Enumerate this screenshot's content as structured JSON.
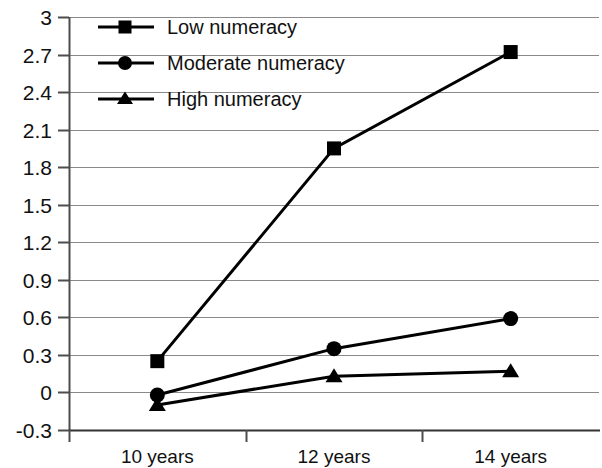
{
  "chart_data": {
    "type": "line",
    "title": "",
    "subtitle": "",
    "xlabel": "",
    "ylabel": "",
    "categories": [
      "10 years",
      "12 years",
      "14 years"
    ],
    "ylim": [
      -0.3,
      3
    ],
    "yticks": [
      "3",
      "2.7",
      "2.4",
      "2.1",
      "1.8",
      "1.5",
      "1.2",
      "0.9",
      "0.6",
      "0.3",
      "0",
      "-0.3"
    ],
    "ytick_values": [
      3,
      2.7,
      2.4,
      2.1,
      1.8,
      1.5,
      1.2,
      0.9,
      0.6,
      0.3,
      0,
      -0.3
    ],
    "grid": true,
    "legend_position": "top-left",
    "series": [
      {
        "name": "Low numeracy",
        "marker": "square",
        "color": "#000000",
        "values": [
          0.25,
          1.95,
          2.72
        ]
      },
      {
        "name": "Moderate numeracy",
        "marker": "circle",
        "color": "#000000",
        "values": [
          -0.02,
          0.35,
          0.59
        ]
      },
      {
        "name": "High numeracy",
        "marker": "triangle",
        "color": "#000000",
        "values": [
          -0.1,
          0.13,
          0.17
        ]
      }
    ]
  },
  "axis": {
    "ytick_0": "3",
    "ytick_1": "2.7",
    "ytick_2": "2.4",
    "ytick_3": "2.1",
    "ytick_4": "1.8",
    "ytick_5": "1.5",
    "ytick_6": "1.2",
    "ytick_7": "0.9",
    "ytick_8": "0.6",
    "ytick_9": "0.3",
    "ytick_10": "0",
    "ytick_11": "-0.3",
    "xtick_0": "10 years",
    "xtick_1": "12 years",
    "xtick_2": "14 years"
  },
  "legend": {
    "item_0": "Low numeracy",
    "item_1": "Moderate numeracy",
    "item_2": "High numeracy"
  },
  "colors": {
    "ink": "#000000",
    "grid": "#8a8a8a",
    "axis": "#4d4d4d",
    "background": "#ffffff"
  }
}
